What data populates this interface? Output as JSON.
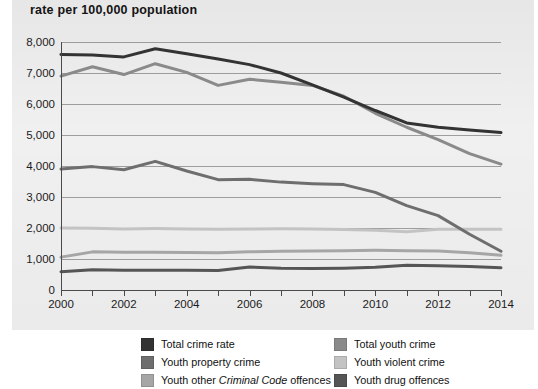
{
  "chart_data": {
    "type": "line",
    "title": "rate per 100,000 population",
    "xlabel": "",
    "ylabel": "rate per 100,000 population",
    "x": [
      2000,
      2001,
      2002,
      2003,
      2004,
      2005,
      2006,
      2007,
      2008,
      2009,
      2010,
      2011,
      2012,
      2013,
      2014
    ],
    "xlim": [
      2000,
      2014
    ],
    "ylim": [
      0,
      8000
    ],
    "yticks": [
      0,
      1000,
      2000,
      3000,
      4000,
      5000,
      6000,
      7000,
      8000
    ],
    "ytick_labels": [
      "0",
      "1,000",
      "2,000",
      "3,000",
      "4,000",
      "5,000",
      "6,000",
      "7,000",
      "8,000"
    ],
    "xtick_labels": [
      "2000",
      "",
      "2002",
      "",
      "2004",
      "",
      "2006",
      "",
      "2008",
      "",
      "2010",
      "",
      "2012",
      "",
      "2014"
    ],
    "grid": true,
    "legend_position": "bottom",
    "series": [
      {
        "name": "Total crime rate",
        "color": "#333333",
        "values": [
          7600,
          7580,
          7520,
          7780,
          7620,
          7450,
          7270,
          7000,
          6620,
          6220,
          5790,
          5390,
          5250,
          5160,
          5080
        ]
      },
      {
        "name": "Total youth crime",
        "color": "#8a8a8a",
        "values": [
          6900,
          7200,
          6950,
          7300,
          7020,
          6600,
          6800,
          6700,
          6600,
          6250,
          5700,
          5250,
          4850,
          4400,
          4060
        ]
      },
      {
        "name": "Youth property crime",
        "color": "#6e6e6e",
        "values": [
          3900,
          3980,
          3880,
          4150,
          3840,
          3560,
          3570,
          3480,
          3430,
          3400,
          3150,
          2720,
          2400,
          1800,
          1250
        ]
      },
      {
        "name": "Youth violent crime",
        "color": "#c3c3c3",
        "values": [
          2000,
          1990,
          1970,
          1980,
          1970,
          1960,
          1970,
          1975,
          1970,
          1950,
          1930,
          1880,
          1960,
          1960,
          1960
        ]
      },
      {
        "name": "Youth other Criminal Code offences",
        "color": "#a6a6a6",
        "values": [
          1060,
          1230,
          1220,
          1220,
          1210,
          1200,
          1230,
          1250,
          1260,
          1270,
          1280,
          1270,
          1260,
          1200,
          1120
        ]
      },
      {
        "name": "Youth drug offences",
        "color": "#555555",
        "values": [
          590,
          650,
          640,
          640,
          640,
          630,
          740,
          700,
          690,
          700,
          730,
          800,
          780,
          760,
          720
        ]
      }
    ]
  },
  "legend": {
    "left": [
      {
        "label": "Total crime rate",
        "color": "#333333",
        "italic_part": ""
      },
      {
        "label": "Youth property crime",
        "color": "#6e6e6e",
        "italic_part": ""
      },
      {
        "label": "Youth other Criminal Code offences",
        "color": "#a6a6a6",
        "italic_part": "Criminal Code"
      }
    ],
    "right": [
      {
        "label": "Total youth crime",
        "color": "#8a8a8a",
        "italic_part": ""
      },
      {
        "label": "Youth violent crime",
        "color": "#c3c3c3",
        "italic_part": ""
      },
      {
        "label": "Youth drug offences",
        "color": "#555555",
        "italic_part": ""
      }
    ]
  },
  "colors": {
    "panel_background": "#e4e4e4",
    "page_background": "#ffffff",
    "gridline": "#8e8e8e",
    "axis": "#4a4a4a",
    "text": "#1a1a1a"
  }
}
